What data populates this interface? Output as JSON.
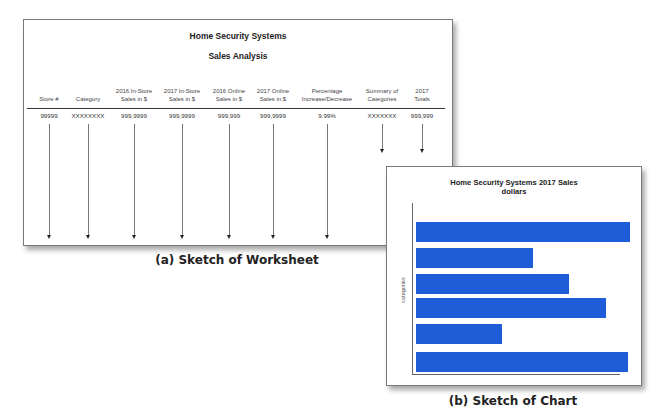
{
  "worksheet": {
    "title": "Home Security Systems",
    "subtitle": "Sales Analysis",
    "columns": [
      {
        "header": "Store #",
        "value": "99999",
        "x": 25,
        "arrow": "long"
      },
      {
        "header": "Category",
        "value": "XXXXXXXX",
        "x": 64,
        "arrow": "long"
      },
      {
        "header": "2016 In-Store\nSales in $",
        "value": "999,9999",
        "x": 110,
        "arrow": "long"
      },
      {
        "header": "2017 In-Store\nSales in $",
        "value": "999,9999",
        "x": 158,
        "arrow": "long"
      },
      {
        "header": "2016 Online\nSales in $",
        "value": "999,999",
        "x": 205,
        "arrow": "long"
      },
      {
        "header": "2017 Online\nSales in $",
        "value": "999,9999",
        "x": 249,
        "arrow": "long"
      },
      {
        "header": "Percentage\nIncrease/Decrease",
        "value": "9.99%",
        "x": 303,
        "arrow": "long"
      },
      {
        "header": "Summary of\nCategories",
        "value": "XXXXXXX",
        "x": 358,
        "arrow": "short"
      },
      {
        "header": "2017\nTotals",
        "value": "999,999",
        "x": 398,
        "arrow": "short"
      }
    ],
    "caption": "(a) Sketch of Worksheet"
  },
  "chart": {
    "title_line1": "Home Security Systems 2017 Sales",
    "title_line2": "dollars",
    "ylabel": "categories",
    "bar_color": "#1e5bd6",
    "caption": "(b) Sketch of Chart"
  },
  "chart_data": {
    "type": "bar",
    "orientation": "horizontal",
    "title": "Home Security Systems 2017 Sales dollars",
    "xlabel": "",
    "ylabel": "categories",
    "categories": [
      "",
      "",
      "",
      "",
      "",
      ""
    ],
    "values": [
      214,
      117,
      153,
      190,
      86,
      212
    ],
    "grid": false,
    "legend": "none",
    "note": "Sketch only; no tick labels shown. Values are bar lengths in pixels (relative)."
  }
}
